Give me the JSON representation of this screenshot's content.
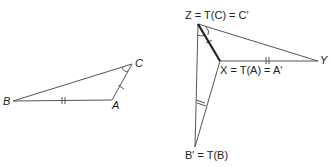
{
  "diagram": {
    "colors": {
      "line": "#555555",
      "thick": "#222222",
      "text": "#222222"
    },
    "triangle1": {
      "label_B": "B",
      "label_A": "A",
      "label_C": "C"
    },
    "triangle2": {
      "label_Z": "Z = T(C) = C′",
      "label_X": "X = T(A) = A′",
      "label_Y": "Y",
      "label_Bp": "B′ = T(B)"
    }
  }
}
